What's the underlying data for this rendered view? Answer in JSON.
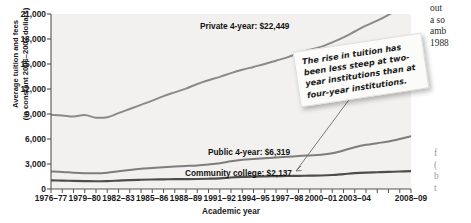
{
  "chart_data": {
    "type": "line",
    "title": "",
    "xlabel": "Academic year",
    "ylabel_line1": "Average tuition and fees",
    "ylabel_line2": "(in constant 2006–2007 dollars)",
    "ylim": [
      0,
      21000
    ],
    "yticks": [
      0,
      3000,
      6000,
      9000,
      12000,
      15000,
      18000,
      21000
    ],
    "ytick_labels": [
      "0",
      "3,000",
      "6,000",
      "9,000",
      "12,000",
      "15,000",
      "18,000",
      "21,000"
    ],
    "grid": false,
    "legend_position": "inline-labels",
    "xtick_labels": [
      "1976–77",
      "1979–80",
      "1982–83",
      "1985–86",
      "1988–89",
      "1991–92",
      "1994–95",
      "1997–98",
      "2000–01",
      "2003–04",
      "2008–09"
    ],
    "x": [
      "1976-77",
      "1977-78",
      "1978-79",
      "1979-80",
      "1980-81",
      "1981-82",
      "1982-83",
      "1983-84",
      "1984-85",
      "1985-86",
      "1986-87",
      "1987-88",
      "1988-89",
      "1989-90",
      "1990-91",
      "1991-92",
      "1992-93",
      "1993-94",
      "1994-95",
      "1995-96",
      "1996-97",
      "1997-98",
      "1998-99",
      "1999-00",
      "2000-01",
      "2001-02",
      "2002-03",
      "2003-04",
      "2004-05",
      "2005-06",
      "2006-07",
      "2007-08",
      "2008-09"
    ],
    "series": [
      {
        "name": "Private 4-year",
        "color": "#8a8a8a",
        "end_label": "Private 4-year: $22,449",
        "end_value": 22449,
        "values": [
          8900,
          8830,
          8700,
          8880,
          8560,
          8620,
          9100,
          9600,
          10100,
          10600,
          11150,
          11600,
          12050,
          12600,
          13050,
          13450,
          13900,
          14300,
          14650,
          15000,
          15400,
          15800,
          16300,
          16700,
          17050,
          17600,
          18200,
          18900,
          19600,
          20200,
          20900,
          21700,
          22449
        ]
      },
      {
        "name": "Public 4-year",
        "color": "#7d7d7d",
        "end_label": "Public 4-year: $6,319",
        "end_value": 6319,
        "values": [
          2100,
          2050,
          1960,
          1900,
          1880,
          1960,
          2120,
          2280,
          2420,
          2520,
          2620,
          2700,
          2760,
          2830,
          2950,
          3100,
          3330,
          3500,
          3600,
          3700,
          3780,
          3860,
          3960,
          4030,
          4100,
          4280,
          4620,
          5000,
          5300,
          5500,
          5700,
          6000,
          6319
        ]
      },
      {
        "name": "Community college",
        "color": "#4d4d4d",
        "end_label": "Community college: $2,137",
        "end_value": 2137,
        "values": [
          1030,
          1010,
          980,
          950,
          930,
          950,
          1010,
          1070,
          1110,
          1140,
          1160,
          1180,
          1190,
          1200,
          1230,
          1280,
          1380,
          1450,
          1490,
          1520,
          1540,
          1560,
          1580,
          1600,
          1620,
          1680,
          1790,
          1900,
          1970,
          2010,
          2050,
          2100,
          2137
        ]
      }
    ],
    "annotation": {
      "text": "The rise in tuition has been less steep at two-year institutions than at four-year institutions.",
      "target": "Community college"
    }
  },
  "margin": {
    "top_text": "out\na so\namb\n1988",
    "bottom_text": "f\n(\nb\nt"
  }
}
